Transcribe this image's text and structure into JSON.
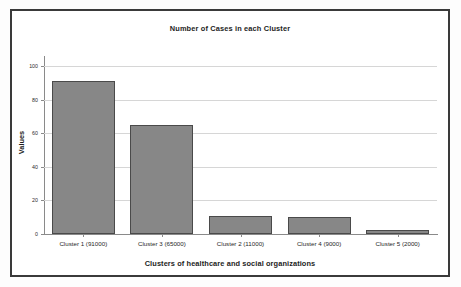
{
  "chart_data": {
    "type": "bar",
    "title": "Number of Cases in each Cluster",
    "xlabel": "Clusters of healthcare and social organizations",
    "ylabel": "Values",
    "categories": [
      "Cluster 1 (91000)",
      "Cluster 3 (65000)",
      "Cluster 2 (11000)",
      "Cluster 4 (9000)",
      "Cluster 5 (2000)"
    ],
    "values": [
      91,
      65,
      11,
      10,
      2.5
    ],
    "ylim": [
      0,
      106
    ],
    "yticks": [
      0,
      20,
      40,
      60,
      80,
      100
    ],
    "ytick_labels": [
      "0",
      "20",
      "40",
      "60",
      "80",
      "100"
    ],
    "grid": "horizontal",
    "legend": "none",
    "bar_color": "#878787",
    "bar_edge_color": "#4a4a4a",
    "gridline_color": "#d6d6d6",
    "axis_color": "#8a8a8a",
    "frame_color": "#3a3a3a",
    "background_color": "#ffffff"
  }
}
